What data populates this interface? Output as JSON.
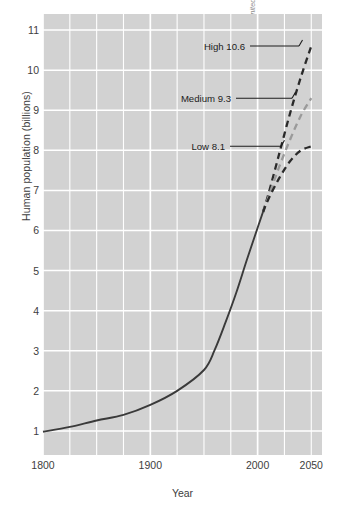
{
  "chart_data": {
    "type": "line",
    "title": "",
    "xlabel": "Year",
    "ylabel": "Human population (billions)",
    "xlim": [
      1800,
      2060
    ],
    "ylim": [
      0.4,
      11.4
    ],
    "xticks": [
      1800,
      1900,
      2000,
      2050
    ],
    "xticklabels": [
      "1800",
      "1900",
      "2000",
      "2050"
    ],
    "yticks": [
      1,
      2,
      3,
      4,
      5,
      6,
      7,
      8,
      9,
      10,
      11
    ],
    "yticklabels": [
      "1",
      "2",
      "3",
      "4",
      "5",
      "6",
      "7",
      "8",
      "9",
      "10",
      "11"
    ],
    "x_minor_gridline_step": 25,
    "y_minor_gridline_step": 1,
    "grid": true,
    "grid_color": "#ffffff",
    "plot_background": "#d2d2d2",
    "legend_position": "inline-annotations",
    "series": [
      {
        "name": "Historical",
        "style": "solid",
        "color": "#3a3a3a",
        "x": [
          1800,
          1825,
          1850,
          1875,
          1900,
          1925,
          1950,
          1960,
          1970,
          1980,
          1990,
          2000,
          2005
        ],
        "values": [
          0.98,
          1.1,
          1.26,
          1.4,
          1.65,
          2.0,
          2.52,
          3.02,
          3.7,
          4.44,
          5.27,
          6.07,
          6.46
        ]
      },
      {
        "name": "High 10.6",
        "style": "dashed",
        "color": "#2a2a2a",
        "x": [
          2005,
          2010,
          2020,
          2030,
          2040,
          2050
        ],
        "values": [
          6.46,
          6.9,
          7.9,
          8.9,
          9.8,
          10.6
        ]
      },
      {
        "name": "Medium 9.3",
        "style": "dashed",
        "color": "#9a9a9a",
        "x": [
          2005,
          2010,
          2020,
          2030,
          2040,
          2050
        ],
        "values": [
          6.46,
          6.83,
          7.58,
          8.25,
          8.85,
          9.3
        ]
      },
      {
        "name": "Low 8.1",
        "style": "dashed",
        "color": "#2a2a2a",
        "x": [
          2005,
          2010,
          2020,
          2030,
          2040,
          2050
        ],
        "values": [
          6.46,
          6.78,
          7.3,
          7.72,
          7.99,
          8.1
        ]
      }
    ],
    "annotations": [
      {
        "text": "High 10.6",
        "value": 10.6,
        "year": 2050
      },
      {
        "text": "Medium 9.3",
        "value": 9.3,
        "year": 2050
      },
      {
        "text": "Low 8.1",
        "value": 8.1,
        "year": 2050
      }
    ],
    "credit_prefix": "Based on data from ",
    "credit_italic": "World Population Prospects: The 2004 Revision, United Nations Population Division"
  }
}
